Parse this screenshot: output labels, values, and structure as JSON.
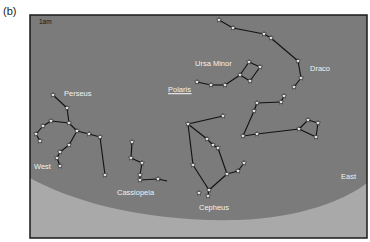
{
  "figure_label": "(b)",
  "time_label": "1am",
  "colors": {
    "sky": "#7b7b7b",
    "ground": "#a9a9a9",
    "border": "#1a1a1a",
    "line": "#111111",
    "star_fill": "#ffffff",
    "label": "#f2f2f2"
  },
  "directions": {
    "west": "West",
    "east": "East"
  },
  "constellations": [
    {
      "name": "Draco",
      "label": "Draco",
      "label_pos": [
        310,
        71
      ],
      "stars": [
        [
          219,
          20
        ],
        [
          233,
          28
        ],
        [
          264,
          34
        ],
        [
          271,
          38
        ],
        [
          298,
          61
        ],
        [
          301,
          78
        ],
        [
          294,
          87
        ],
        [
          284,
          96
        ],
        [
          281,
          102
        ],
        [
          257,
          103
        ],
        [
          254,
          111
        ],
        [
          243,
          136
        ],
        [
          257,
          134
        ],
        [
          299,
          129
        ],
        [
          308,
          120
        ],
        [
          318,
          123
        ],
        [
          316,
          137
        ]
      ],
      "lines": [
        [
          0,
          1
        ],
        [
          1,
          2
        ],
        [
          2,
          3
        ],
        [
          3,
          4
        ],
        [
          4,
          5
        ],
        [
          5,
          6
        ],
        [
          7,
          8
        ],
        [
          8,
          9
        ],
        [
          9,
          10
        ],
        [
          10,
          11
        ],
        [
          11,
          12
        ],
        [
          12,
          13
        ],
        [
          13,
          14
        ],
        [
          14,
          15
        ],
        [
          15,
          16
        ],
        [
          16,
          13
        ]
      ]
    },
    {
      "name": "Ursa Minor",
      "label": "Ursa Minor",
      "label_pos": [
        195,
        66
      ],
      "stars": [
        [
          197,
          82
        ],
        [
          211,
          85
        ],
        [
          225,
          85
        ],
        [
          240,
          75
        ],
        [
          249,
          62
        ],
        [
          260,
          67
        ],
        [
          250,
          81
        ]
      ],
      "lines": [
        [
          0,
          1
        ],
        [
          1,
          2
        ],
        [
          2,
          3
        ],
        [
          3,
          4
        ],
        [
          4,
          5
        ],
        [
          5,
          6
        ],
        [
          6,
          3
        ]
      ]
    },
    {
      "name": "Perseus",
      "label": "Perseus",
      "label_pos": [
        64,
        96
      ],
      "stars": [
        [
          53,
          95
        ],
        [
          67,
          108
        ],
        [
          69,
          123
        ],
        [
          51,
          121
        ],
        [
          43,
          126
        ],
        [
          36,
          134
        ],
        [
          40,
          141
        ],
        [
          77,
          131
        ],
        [
          89,
          134
        ],
        [
          100,
          137
        ],
        [
          105,
          175
        ],
        [
          69,
          145
        ],
        [
          60,
          152
        ],
        [
          57,
          158
        ],
        [
          60,
          166
        ]
      ],
      "lines": [
        [
          0,
          1
        ],
        [
          1,
          2
        ],
        [
          2,
          3
        ],
        [
          3,
          4
        ],
        [
          4,
          5
        ],
        [
          5,
          6
        ],
        [
          2,
          7
        ],
        [
          7,
          8
        ],
        [
          8,
          9
        ],
        [
          9,
          10
        ],
        [
          7,
          11
        ],
        [
          11,
          12
        ],
        [
          12,
          13
        ],
        [
          13,
          14
        ]
      ]
    },
    {
      "name": "Cassiopeia",
      "label": "Cassiopeia",
      "label_pos": [
        117,
        195
      ],
      "stars": [
        [
          132,
          142
        ],
        [
          131,
          158
        ],
        [
          142,
          163
        ],
        [
          140,
          175
        ],
        [
          140,
          180
        ],
        [
          158,
          179
        ]
      ],
      "tail": [
        167,
        181
      ],
      "lines": [
        [
          0,
          1
        ],
        [
          1,
          2
        ],
        [
          2,
          3
        ],
        [
          3,
          4
        ],
        [
          4,
          5
        ]
      ]
    },
    {
      "name": "Cepheus",
      "label": "Cepheus",
      "label_pos": [
        199,
        210
      ],
      "stars": [
        [
          223,
          116
        ],
        [
          188,
          124
        ],
        [
          193,
          165
        ],
        [
          209,
          190
        ],
        [
          208,
          196
        ],
        [
          199,
          193
        ],
        [
          207,
          139
        ],
        [
          213,
          145
        ],
        [
          218,
          148
        ],
        [
          227,
          174
        ],
        [
          238,
          171
        ],
        [
          244,
          163
        ]
      ],
      "lines": [
        [
          0,
          1
        ],
        [
          1,
          2
        ],
        [
          2,
          3
        ],
        [
          3,
          4
        ],
        [
          1,
          6
        ],
        [
          6,
          7
        ],
        [
          7,
          8
        ],
        [
          8,
          9
        ],
        [
          9,
          3
        ],
        [
          9,
          10
        ],
        [
          10,
          11
        ]
      ]
    }
  ],
  "highlight": {
    "label": "Polaris",
    "label_pos": [
      168,
      92
    ],
    "underlined": true
  }
}
